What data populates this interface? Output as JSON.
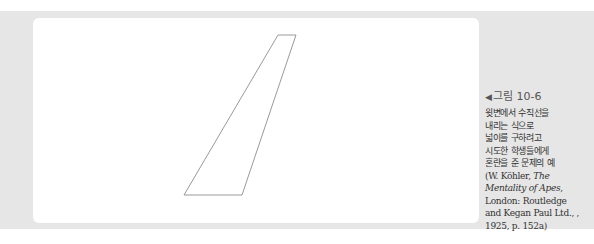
{
  "figure": {
    "shape": "parallelogram",
    "points": "278,35 296,35 242,195 184,195",
    "stroke": "#9a9a9a"
  },
  "caption": {
    "arrow": "◀",
    "label": "그림 10-6",
    "lines": [
      "윗변에서 수직선을",
      "내리는 식으로",
      "넓이를 구하려고",
      "시도한 학생들에게",
      "혼란을 준 문제의 예"
    ],
    "citation": {
      "prefix": "(W. Köhler, ",
      "title_part1": "The",
      "title_part2": "Mentality of Apes",
      "after_title": ",",
      "line_london": "London: Routledge",
      "line_kegan": "and Kegan Paul Ltd., ,",
      "line_year": "1925, p. 152a)"
    }
  }
}
